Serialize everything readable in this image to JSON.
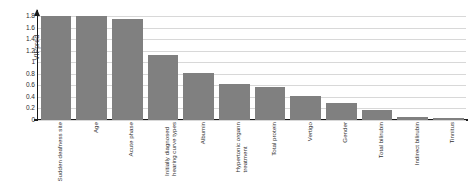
{
  "chart_data": {
    "type": "bar",
    "title": "",
    "subtitle": "",
    "xlabel": "",
    "ylabel": "VIPpred",
    "ylim": [
      0,
      1.8
    ],
    "grid": true,
    "legend": null,
    "orientation": "vertical",
    "bar_color": "#808080",
    "yticks": [
      "1.8",
      "1.6",
      "1.4",
      "1.2",
      "1",
      "0.8",
      "0.6",
      "0.4",
      "0.2",
      "0"
    ],
    "ytick_values": [
      1.8,
      1.6,
      1.4,
      1.2,
      1.0,
      0.8,
      0.6,
      0.4,
      0.2,
      0.0
    ],
    "categories": [
      "Sudden deafness site",
      "Age",
      "Acute phase",
      "Initially diagnosed hearing curve types",
      "Albumin",
      "Hypertonic complex treatment",
      "Total protein",
      "Vertigo",
      "Gender",
      "Total bilirubin",
      "Indirect bilirubin",
      "Tinnitus"
    ],
    "category_lines": [
      [
        "Sudden deafness site"
      ],
      [
        "Age"
      ],
      [
        "Acute phase"
      ],
      [
        "Initially diagnosed",
        "hearing curve types"
      ],
      [
        "Albumin"
      ],
      [
        "Hypertonic organn",
        "treatment"
      ],
      [
        "Total protein"
      ],
      [
        "Vertigo"
      ],
      [
        "Gender"
      ],
      [
        "Total bilirubin"
      ],
      [
        "Indirect bilirubin"
      ],
      [
        "Tinnitus"
      ]
    ],
    "values": [
      1.8,
      1.8,
      1.75,
      1.12,
      0.82,
      0.63,
      0.58,
      0.42,
      0.3,
      0.17,
      0.06,
      0.03
    ]
  }
}
